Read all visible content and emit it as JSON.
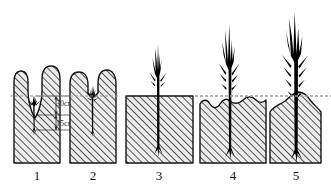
{
  "figure": {
    "background_color": "#ffffff",
    "soil_fill_color": "#e9e9e9",
    "soil_outline_color": "#1a1a1a",
    "hatch_color": "#3a3a3a",
    "plant_color": "#000000",
    "ground_line_color": "#8a8a8a"
  },
  "ground_line": {
    "name": "ground-reference-line",
    "style": "dashed",
    "y": 96
  },
  "dimensions": [
    {
      "id": "depth-upper",
      "label": "30cm",
      "value": 30,
      "unit": "cm"
    },
    {
      "id": "depth-lower",
      "label": "15cm",
      "value": 15,
      "unit": "cm"
    }
  ],
  "panels": [
    {
      "number": "1",
      "name": "panel-stage-1",
      "top_shape": "v-notch-between-mounds",
      "plant_size": "seedling",
      "plant_height": 28
    },
    {
      "number": "2",
      "name": "panel-stage-2",
      "top_shape": "dip-between-mounds",
      "plant_size": "seedling",
      "plant_height": 34
    },
    {
      "number": "3",
      "name": "panel-stage-3",
      "top_shape": "flat",
      "plant_size": "sapling",
      "plant_height": 62
    },
    {
      "number": "4",
      "name": "panel-stage-4",
      "top_shape": "scalloped",
      "plant_size": "young-tree",
      "plant_height": 78
    },
    {
      "number": "5",
      "name": "panel-stage-5",
      "top_shape": "raised-mound",
      "plant_size": "mature-tree",
      "plant_height": 92
    }
  ]
}
